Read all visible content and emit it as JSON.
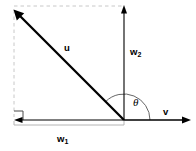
{
  "diagram": {
    "background_color": "#ffffff",
    "stroke_color": "#000000",
    "dashed_color": "#c8c8c8",
    "bracket_color": "#b4b4b4",
    "arc_color": "#555555",
    "width": 196,
    "height": 151,
    "origin": {
      "x": 124,
      "y": 120
    },
    "labels": {
      "u": "u",
      "w": "w",
      "w1_sub": "1",
      "w2_sub": "2",
      "v": "v",
      "theta": "θ"
    },
    "vectors": [
      {
        "name": "u",
        "label": "u",
        "from": {
          "x": 124,
          "y": 120
        },
        "to": {
          "x": 14,
          "y": 10
        },
        "style": "solid",
        "arrowhead": "end",
        "thickness": 2.2
      },
      {
        "name": "w2",
        "label": "w2",
        "from": {
          "x": 124,
          "y": 120
        },
        "to": {
          "x": 124,
          "y": 6
        },
        "style": "solid",
        "arrowhead": "end",
        "thickness": 1.1
      },
      {
        "name": "w1",
        "label": "w1",
        "from": {
          "x": 124,
          "y": 120
        },
        "to": {
          "x": 14,
          "y": 120
        },
        "style": "solid",
        "arrowhead": "end",
        "thickness": 1.1
      },
      {
        "name": "v",
        "label": "v",
        "from": {
          "x": 124,
          "y": 120
        },
        "to": {
          "x": 191,
          "y": 120
        },
        "style": "solid",
        "arrowhead": "end",
        "thickness": 1.6
      }
    ],
    "guides": [
      {
        "name": "top-dashed",
        "from": {
          "x": 14,
          "y": 6
        },
        "to": {
          "x": 124,
          "y": 6
        },
        "style": "dashed"
      },
      {
        "name": "left-dashed",
        "from": {
          "x": 14,
          "y": 10
        },
        "to": {
          "x": 14,
          "y": 117
        },
        "style": "dashed"
      }
    ],
    "angle_arc": {
      "name": "theta",
      "label": "θ",
      "center": {
        "x": 124,
        "y": 120
      },
      "radius": 26,
      "start_deg": 0,
      "end_deg": 135
    },
    "right_angle_marker": {
      "name": "right-angle",
      "corner": {
        "x": 14,
        "y": 120
      },
      "size": 9
    },
    "measure_bracket": {
      "name": "w1-bracket",
      "from": {
        "x": 14,
        "y": 125
      },
      "to": {
        "x": 124,
        "y": 125
      },
      "tick": 4
    }
  }
}
